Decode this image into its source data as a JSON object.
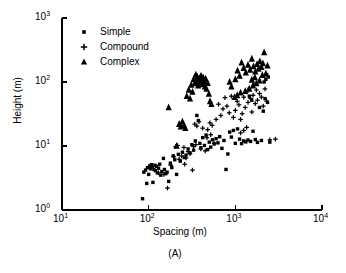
{
  "chart_data": {
    "type": "scatter",
    "title": "",
    "caption": "(A)",
    "xlabel": "Spacing (m)",
    "ylabel": "Height (m)",
    "xscale": "log",
    "yscale": "log",
    "xlim": [
      10,
      10000
    ],
    "ylim": [
      1,
      1000
    ],
    "xticks": [
      10,
      100,
      1000,
      10000
    ],
    "xtick_labels": [
      "10",
      "10",
      "10",
      "10"
    ],
    "xtick_exponents": [
      "1",
      "2",
      "3",
      "4"
    ],
    "yticks": [
      1,
      10,
      100,
      1000
    ],
    "ytick_labels": [
      "10",
      "10",
      "10",
      "10"
    ],
    "ytick_exponents": [
      "0",
      "1",
      "2",
      "3"
    ],
    "grid": false,
    "legend_position": "top-left",
    "marker_color": "#000000",
    "series": [
      {
        "name": "Simple",
        "marker": "square",
        "points": [
          [
            85,
            1.5
          ],
          [
            88,
            3.9
          ],
          [
            92,
            4.2
          ],
          [
            95,
            2.6
          ],
          [
            97,
            4.6
          ],
          [
            100,
            3.6
          ],
          [
            103,
            4.9
          ],
          [
            105,
            4.4
          ],
          [
            108,
            5.1
          ],
          [
            110,
            4.7
          ],
          [
            112,
            2.7
          ],
          [
            115,
            4.3
          ],
          [
            118,
            5.0
          ],
          [
            120,
            4.1
          ],
          [
            123,
            4.8
          ],
          [
            126,
            3.8
          ],
          [
            130,
            4.5
          ],
          [
            134,
            5.2
          ],
          [
            138,
            3.5
          ],
          [
            142,
            4.0
          ],
          [
            148,
            6.4
          ],
          [
            152,
            4.3
          ],
          [
            158,
            3.7
          ],
          [
            163,
            3.9
          ],
          [
            170,
            2.8
          ],
          [
            178,
            5.4
          ],
          [
            185,
            4.6
          ],
          [
            192,
            7.0
          ],
          [
            200,
            6.1
          ],
          [
            210,
            3.6
          ],
          [
            220,
            7.4
          ],
          [
            232,
            5.8
          ],
          [
            245,
            8.0
          ],
          [
            258,
            6.6
          ],
          [
            270,
            7.2
          ],
          [
            285,
            9.0
          ],
          [
            300,
            7.8
          ],
          [
            315,
            10.5
          ],
          [
            330,
            8.6
          ],
          [
            345,
            12.0
          ],
          [
            360,
            30.0
          ],
          [
            375,
            25.0
          ],
          [
            390,
            11.0
          ],
          [
            400,
            9.4
          ],
          [
            420,
            13.5
          ],
          [
            440,
            10.2
          ],
          [
            460,
            14.8
          ],
          [
            480,
            8.8
          ],
          [
            500,
            11.5
          ],
          [
            520,
            9.6
          ],
          [
            545,
            12.5
          ],
          [
            570,
            10.8
          ],
          [
            600,
            13.0
          ],
          [
            630,
            11.2
          ],
          [
            660,
            14.0
          ],
          [
            700,
            9.2
          ],
          [
            740,
            12.2
          ],
          [
            780,
            4.3
          ],
          [
            820,
            7.5
          ],
          [
            860,
            16.5
          ],
          [
            900,
            13.8
          ],
          [
            950,
            17.5
          ],
          [
            1000,
            11.0
          ],
          [
            1060,
            18.5
          ],
          [
            1120,
            12.8
          ],
          [
            1180,
            10.9
          ],
          [
            1250,
            12.0
          ],
          [
            1320,
            11.6
          ],
          [
            1400,
            12.4
          ],
          [
            1500,
            11.8
          ],
          [
            1600,
            17.0
          ],
          [
            1700,
            12.6
          ],
          [
            1800,
            11.4
          ],
          [
            1900,
            40.0
          ],
          [
            2000,
            12.2
          ],
          [
            2100,
            35.0
          ],
          [
            2200,
            55.0
          ],
          [
            2350,
            48.0
          ],
          [
            2500,
            11.5
          ],
          [
            1450,
            60.0
          ],
          [
            1550,
            52.0
          ],
          [
            2250,
            110.0
          ],
          [
            2400,
            120.0
          ],
          [
            2300,
            130.0
          ],
          [
            2150,
            100.0
          ]
        ]
      },
      {
        "name": "Compound",
        "marker": "plus",
        "points": [
          [
            130,
            3.8
          ],
          [
            150,
            3.6
          ],
          [
            165,
            2.2
          ],
          [
            180,
            5.0
          ],
          [
            195,
            6.8
          ],
          [
            205,
            9.8
          ],
          [
            215,
            10.2
          ],
          [
            225,
            6.2
          ],
          [
            240,
            7.0
          ],
          [
            255,
            9.5
          ],
          [
            270,
            6.5
          ],
          [
            285,
            8.2
          ],
          [
            300,
            7.6
          ],
          [
            320,
            4.2
          ],
          [
            340,
            22.0
          ],
          [
            360,
            20.5
          ],
          [
            380,
            24.0
          ],
          [
            400,
            9.0
          ],
          [
            420,
            19.0
          ],
          [
            450,
            8.4
          ],
          [
            480,
            18.0
          ],
          [
            510,
            23.0
          ],
          [
            540,
            21.0
          ],
          [
            570,
            11.0
          ],
          [
            600,
            26.0
          ],
          [
            640,
            45.0
          ],
          [
            680,
            30.0
          ],
          [
            720,
            38.0
          ],
          [
            760,
            57.0
          ],
          [
            800,
            42.0
          ],
          [
            850,
            33.0
          ],
          [
            900,
            60.0
          ],
          [
            950,
            28.0
          ],
          [
            1000,
            36.0
          ],
          [
            1050,
            50.0
          ],
          [
            1100,
            44.0
          ],
          [
            1150,
            26.0
          ],
          [
            1200,
            32.0
          ],
          [
            1250,
            58.0
          ],
          [
            1300,
            40.0
          ],
          [
            1350,
            70.0
          ],
          [
            1400,
            48.0
          ],
          [
            1450,
            80.0
          ],
          [
            1500,
            55.0
          ],
          [
            1550,
            34.0
          ],
          [
            1600,
            62.0
          ],
          [
            1650,
            90.0
          ],
          [
            1700,
            46.0
          ],
          [
            1750,
            75.0
          ],
          [
            1800,
            52.0
          ],
          [
            1900,
            66.0
          ],
          [
            2000,
            58.0
          ],
          [
            2100,
            42.0
          ],
          [
            2200,
            78.0
          ],
          [
            2300,
            50.0
          ],
          [
            2500,
            12.5
          ],
          [
            2900,
            12.8
          ],
          [
            1250,
            17.5
          ],
          [
            1350,
            19.5
          ],
          [
            1150,
            16.0
          ],
          [
            470,
            13.5
          ],
          [
            520,
            15.0
          ],
          [
            350,
            10.5
          ],
          [
            330,
            9.8
          ],
          [
            260,
            5.2
          ]
        ]
      },
      {
        "name": "Complex",
        "marker": "triangle",
        "points": [
          [
            170,
            40.0
          ],
          [
            210,
            10.0
          ],
          [
            225,
            22.0
          ],
          [
            235,
            20.0
          ],
          [
            245,
            24.0
          ],
          [
            255,
            21.0
          ],
          [
            265,
            19.0
          ],
          [
            275,
            60.0
          ],
          [
            290,
            75.0
          ],
          [
            300,
            55.0
          ],
          [
            310,
            90.0
          ],
          [
            320,
            70.0
          ],
          [
            330,
            110.0
          ],
          [
            340,
            95.0
          ],
          [
            350,
            130.0
          ],
          [
            358,
            100.0
          ],
          [
            365,
            120.0
          ],
          [
            372,
            88.0
          ],
          [
            380,
            105.0
          ],
          [
            388,
            115.0
          ],
          [
            395,
            98.0
          ],
          [
            402,
            125.0
          ],
          [
            410,
            108.0
          ],
          [
            418,
            92.0
          ],
          [
            425,
            118.0
          ],
          [
            435,
            102.0
          ],
          [
            445,
            85.0
          ],
          [
            455,
            112.0
          ],
          [
            465,
            78.0
          ],
          [
            480,
            96.0
          ],
          [
            495,
            65.0
          ],
          [
            510,
            50.0
          ],
          [
            530,
            45.0
          ],
          [
            860,
            100.0
          ],
          [
            900,
            85.0
          ],
          [
            1000,
            110.0
          ],
          [
            1060,
            150.0
          ],
          [
            1120,
            125.0
          ],
          [
            1180,
            200.0
          ],
          [
            1250,
            165.0
          ],
          [
            1320,
            140.0
          ],
          [
            1400,
            185.0
          ],
          [
            1480,
            155.0
          ],
          [
            1550,
            230.0
          ],
          [
            1620,
            175.0
          ],
          [
            1700,
            145.0
          ],
          [
            1780,
            190.0
          ],
          [
            1850,
            160.0
          ],
          [
            1920,
            210.0
          ],
          [
            2000,
            170.0
          ],
          [
            2080,
            195.0
          ],
          [
            2150,
            290.0
          ],
          [
            2250,
            135.0
          ],
          [
            2350,
            180.0
          ],
          [
            1900,
            105.0
          ],
          [
            1750,
            95.0
          ],
          [
            1600,
            88.0
          ],
          [
            1450,
            78.0
          ],
          [
            1300,
            72.0
          ],
          [
            1150,
            68.0
          ],
          [
            1050,
            62.0
          ],
          [
            980,
            58.0
          ],
          [
            1680,
            118.0
          ],
          [
            1550,
            108.0
          ],
          [
            2050,
            128.0
          ]
        ]
      }
    ]
  },
  "legend": {
    "items": [
      {
        "label": "Simple",
        "marker": "square"
      },
      {
        "label": "Compound",
        "marker": "plus"
      },
      {
        "label": "Complex",
        "marker": "triangle"
      }
    ]
  }
}
